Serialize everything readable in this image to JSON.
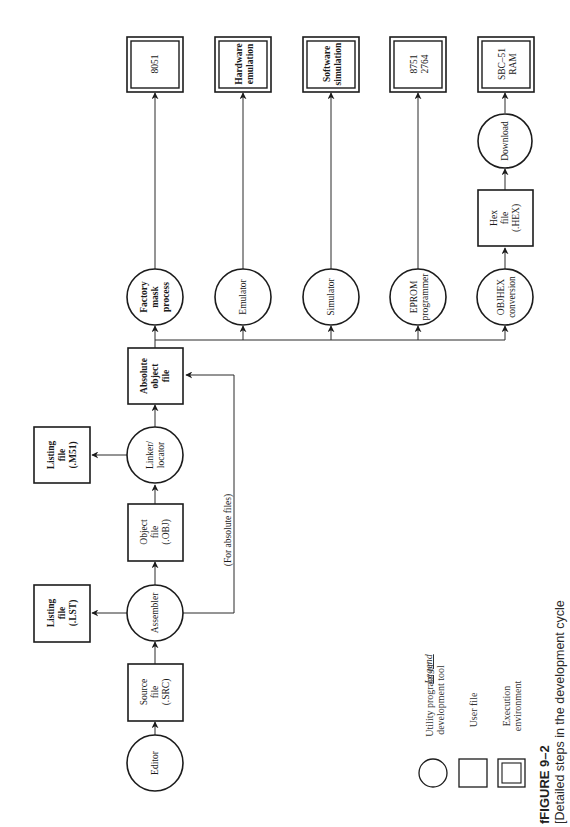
{
  "figure": {
    "number": "FIGURE 9–2",
    "number_prefix_artifact": "f",
    "caption": "Detailed steps in the development cycle",
    "caption_prefix_artifact": "[",
    "orientation": "rotated 90° counter-clockwise"
  },
  "nodes": {
    "editor": {
      "label": [
        "Editor"
      ],
      "kind": "utility"
    },
    "source_file": {
      "label": [
        "Source",
        "file",
        "(.SRC)"
      ],
      "kind": "user-file"
    },
    "assembler": {
      "label": [
        "Assembler"
      ],
      "kind": "utility"
    },
    "listing_lst": {
      "label": [
        "Listing",
        "file",
        "(.LST)"
      ],
      "kind": "user-file"
    },
    "object_file": {
      "label": [
        "Object",
        "file",
        "(.OBJ)"
      ],
      "kind": "user-file"
    },
    "linker_locator": {
      "label": [
        "Linker/",
        "locator"
      ],
      "kind": "utility"
    },
    "listing_m51": {
      "label": [
        "Listing",
        "file",
        "(.M51)"
      ],
      "kind": "user-file"
    },
    "absolute_object_file": {
      "label": [
        "Absolute",
        "object",
        "file"
      ],
      "kind": "user-file"
    },
    "factory_mask": {
      "label": [
        "Factory",
        "mask",
        "process"
      ],
      "kind": "utility"
    },
    "emulator": {
      "label": [
        "Emulator"
      ],
      "kind": "utility"
    },
    "simulator": {
      "label": [
        "Simulator"
      ],
      "kind": "utility"
    },
    "eprom_programmer": {
      "label": [
        "EPROM",
        "programmer"
      ],
      "kind": "utility"
    },
    "objhex_conversion": {
      "label": [
        "OBJHEX",
        "conversion"
      ],
      "kind": "utility"
    },
    "hex_file": {
      "label": [
        "Hex",
        "file",
        "(.HEX)"
      ],
      "kind": "user-file"
    },
    "download": {
      "label": [
        "Download"
      ],
      "kind": "utility"
    },
    "env_8051": {
      "label": [
        "8051"
      ],
      "kind": "execution-environment"
    },
    "env_hardware_emulation": {
      "label": [
        "Hardware",
        "emulation"
      ],
      "kind": "execution-environment"
    },
    "env_software_simulation": {
      "label": [
        "Software",
        "simulation"
      ],
      "kind": "execution-environment"
    },
    "env_8751_2764": {
      "label": [
        "8751",
        "2764"
      ],
      "kind": "execution-environment"
    },
    "env_sbc51_ram": {
      "label": [
        "SBC–51",
        "RAM"
      ],
      "kind": "execution-environment"
    }
  },
  "edges": [
    {
      "from": "editor",
      "to": "source_file"
    },
    {
      "from": "source_file",
      "to": "assembler"
    },
    {
      "from": "assembler",
      "to": "listing_lst"
    },
    {
      "from": "assembler",
      "to": "object_file"
    },
    {
      "from": "assembler",
      "to": "absolute_object_file",
      "label": "(For absolute files)"
    },
    {
      "from": "object_file",
      "to": "linker_locator"
    },
    {
      "from": "linker_locator",
      "to": "listing_m51"
    },
    {
      "from": "linker_locator",
      "to": "absolute_object_file"
    },
    {
      "from": "absolute_object_file",
      "to": "factory_mask"
    },
    {
      "from": "absolute_object_file",
      "to": "emulator"
    },
    {
      "from": "absolute_object_file",
      "to": "simulator"
    },
    {
      "from": "absolute_object_file",
      "to": "eprom_programmer"
    },
    {
      "from": "absolute_object_file",
      "to": "objhex_conversion"
    },
    {
      "from": "factory_mask",
      "to": "env_8051"
    },
    {
      "from": "emulator",
      "to": "env_hardware_emulation"
    },
    {
      "from": "simulator",
      "to": "env_software_simulation"
    },
    {
      "from": "eprom_programmer",
      "to": "env_8751_2764"
    },
    {
      "from": "objhex_conversion",
      "to": "hex_file"
    },
    {
      "from": "hex_file",
      "to": "download"
    },
    {
      "from": "download",
      "to": "env_sbc51_ram"
    }
  ],
  "edge_labels": {
    "absolute_path": "(For absolute files)"
  },
  "legend": {
    "title": "Legend",
    "items": [
      {
        "shape": "circle",
        "label": [
          "Utility program or",
          "development tool"
        ]
      },
      {
        "shape": "square",
        "label": [
          "User file"
        ]
      },
      {
        "shape": "double-square",
        "label": [
          "Execution",
          "environment"
        ]
      }
    ]
  },
  "colors": {
    "background": "#ffffff",
    "stroke": "#1c1c1c",
    "text": "#1a1a1a"
  }
}
